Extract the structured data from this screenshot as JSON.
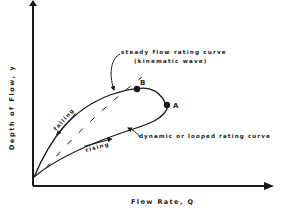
{
  "figure": {
    "x_axis_label": "Flow Rate, Q",
    "y_axis_label": "Depth of Flow, y",
    "steady_curve_label_line1": "steady flow rating curve",
    "steady_curve_label_line2": "(kinematic wave)",
    "dynamic_curve_label": "dynamic or looped rating curve",
    "falling_label": "falling",
    "rising_label": "rising",
    "point_b_label": "B",
    "point_a_label": "A",
    "colors": {
      "ink": "#1a1a1a",
      "background": "#ffffff"
    }
  }
}
